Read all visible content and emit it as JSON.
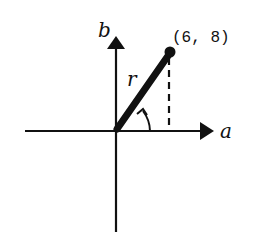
{
  "diagram": {
    "type": "polar-coordinate-vector",
    "axes": {
      "horizontal_label": "a",
      "vertical_label": "b"
    },
    "point": {
      "label": "(6, 8)",
      "x": 6,
      "y": 8
    },
    "vector_label": "r",
    "angle_marker": "counterclockwise-arc",
    "projection": "dashed-vertical-line"
  },
  "colors": {
    "stroke": "#111111",
    "background": "#ffffff"
  }
}
